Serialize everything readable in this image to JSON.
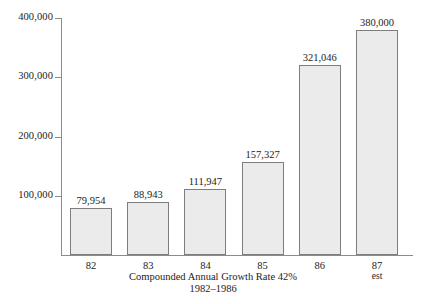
{
  "chart_data": {
    "type": "bar",
    "title": "",
    "subtitle": "",
    "xlabel": "Compounded Annual Growth Rate 42%",
    "ylabel": "",
    "categories": [
      "82",
      "83",
      "84",
      "85",
      "86",
      "87"
    ],
    "category_sublabels": [
      "",
      "",
      "",
      "",
      "",
      "est"
    ],
    "values": [
      79954,
      88943,
      111947,
      157327,
      321046,
      380000
    ],
    "value_labels": [
      "79,954",
      "88,943",
      "111,947",
      "157,327",
      "321,046",
      "380,000"
    ],
    "ylim": [
      0,
      400000
    ],
    "yticks": [
      100000,
      200000,
      300000,
      400000
    ],
    "ytick_labels": [
      "100,000",
      "200,000",
      "300,000",
      "400,000"
    ],
    "grid": false,
    "legend": "none",
    "bar_fill_color": "#ebebeb",
    "bar_border_color": "#7d7d7d",
    "axis_color": "#8b8b8b",
    "text_color": "#1c1c1c"
  },
  "caption": {
    "line1": "Compounded Annual Growth Rate 42%",
    "line2": "1982–1986"
  }
}
